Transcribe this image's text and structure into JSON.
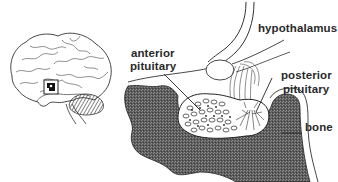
{
  "diagram": {
    "type": "anatomical illustration",
    "inset": {
      "name": "brain side view",
      "highlight": "pituitary region box"
    },
    "labels": {
      "hypothalamus": "hypothalamus",
      "anterior_line1": "anterior",
      "anterior_line2": "pituitary",
      "posterior_line1": "posterior",
      "posterior_line2": "pituitary",
      "bone": "bone"
    },
    "colors": {
      "line": "#2a2a2a",
      "bone_fill": "#5a5a5a",
      "background": "#ffffff"
    }
  }
}
